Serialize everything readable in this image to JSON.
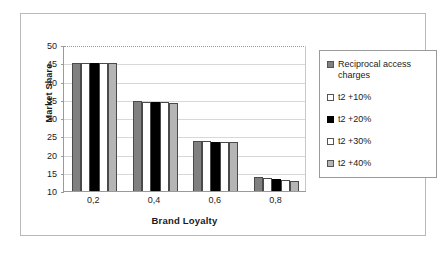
{
  "chart_data": {
    "type": "bar",
    "title": "",
    "xlabel": "Brand Loyalty",
    "ylabel": "Market Share",
    "categories": [
      "0,2",
      "0,4",
      "0,6",
      "0,8"
    ],
    "ylim": [
      10,
      50
    ],
    "yticks": [
      50,
      45,
      40,
      35,
      30,
      25,
      20,
      15,
      10
    ],
    "grid": true,
    "legend_position": "right",
    "series": [
      {
        "name": "Reciprocal access charges",
        "color": "#808080",
        "values": [
          45.0,
          34.6,
          23.7,
          13.8
        ]
      },
      {
        "name": "t2 +10%",
        "color": "#ffffff",
        "values": [
          45.0,
          34.5,
          23.6,
          13.6
        ]
      },
      {
        "name": "t2 +20%",
        "color": "#000000",
        "values": [
          45.0,
          34.3,
          23.5,
          13.4
        ]
      },
      {
        "name": "t2 +30%",
        "color": "#ffffff",
        "values": [
          45.2,
          34.3,
          23.4,
          13.0
        ]
      },
      {
        "name": "t2 +40%",
        "color": "#b5b5b5",
        "values": [
          45.2,
          34.2,
          23.3,
          12.7
        ]
      }
    ]
  },
  "axes": {
    "y_title": "Market Share",
    "x_title": "Brand Loyalty"
  },
  "legend": {
    "items": [
      {
        "label": "Reciprocal access charges",
        "swatch": "#808080"
      },
      {
        "label": "t2 +10%",
        "swatch": "#ffffff"
      },
      {
        "label": "t2 +20%",
        "swatch": "#000000"
      },
      {
        "label": "t2 +30%",
        "swatch": "#ffffff"
      },
      {
        "label": "t2 +40%",
        "swatch": "#b5b5b5"
      }
    ]
  }
}
